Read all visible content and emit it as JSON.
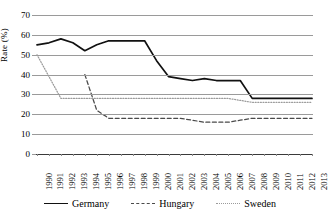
{
  "chart_data": {
    "type": "line",
    "title": "",
    "xlabel": "",
    "ylabel": "Rate (%)",
    "ylim": [
      0,
      70
    ],
    "ytick_labels": [
      "0",
      "10",
      "20",
      "30",
      "40",
      "50",
      "60",
      "70"
    ],
    "ytick_values": [
      0,
      10,
      20,
      30,
      40,
      50,
      60,
      70
    ],
    "grid": "horizontal",
    "legend_position": "bottom",
    "categories": [
      "1990",
      "1991",
      "1992",
      "1993",
      "1994",
      "1995",
      "1996",
      "1997",
      "1998",
      "1999",
      "2000",
      "2001",
      "2002",
      "2003",
      "2004",
      "2005",
      "2006",
      "2007",
      "2008",
      "2009",
      "2010",
      "2011",
      "2012",
      "2013"
    ],
    "series": [
      {
        "name": "Germany",
        "style": "solid",
        "color": "#111111",
        "values": [
          55,
          56,
          58,
          56,
          52,
          55,
          57,
          57,
          57,
          57,
          47,
          39,
          38,
          37,
          38,
          37,
          37,
          37,
          28,
          28,
          28,
          28,
          28,
          28
        ]
      },
      {
        "name": "Hungary",
        "style": "dashed",
        "color": "#4a4a4a",
        "values": [
          null,
          null,
          null,
          null,
          40,
          22,
          18,
          18,
          18,
          18,
          18,
          18,
          18,
          17,
          16,
          16,
          16,
          17,
          18,
          18,
          18,
          18,
          18,
          18
        ]
      },
      {
        "name": "Sweden",
        "style": "dotted",
        "color": "#9b9b9b",
        "values": [
          50,
          39,
          28,
          28,
          28,
          28,
          28,
          28,
          28,
          28,
          28,
          28,
          28,
          28,
          28,
          28,
          28,
          27,
          26,
          26,
          26,
          26,
          26,
          26
        ]
      }
    ]
  },
  "legend": {
    "items": [
      {
        "label": "Germany"
      },
      {
        "label": "Hungary"
      },
      {
        "label": "Sweden"
      }
    ]
  },
  "axis": {
    "y_caption": "Rate (%)"
  }
}
